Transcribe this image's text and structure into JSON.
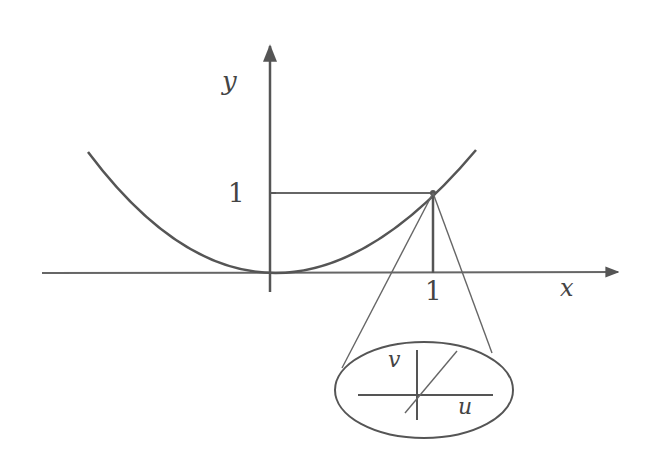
{
  "diagram": {
    "labels": {
      "y_axis": "y",
      "x_axis": "x",
      "y_tick": "1",
      "x_tick": "1",
      "zoom_v": "v",
      "zoom_u": "u"
    },
    "colors": {
      "stroke": "#555555",
      "background": "#ffffff"
    }
  }
}
